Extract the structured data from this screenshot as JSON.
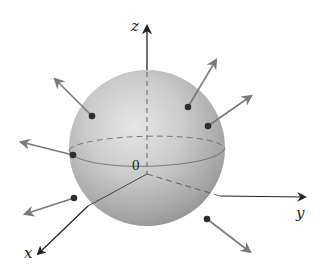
{
  "figure": {
    "colors": {
      "background": "#ffffff",
      "sphere_light": "#e4e4e4",
      "sphere_mid": "#c4c4c4",
      "sphere_dark": "#8e8e8e",
      "axis": "#222222",
      "normal_vector": "#7a7a7a",
      "point": "#2e2e2e",
      "equator": "#6f6f6f"
    },
    "axes": {
      "z": {
        "label": "z"
      },
      "y": {
        "label": "y"
      },
      "x": {
        "label": "x"
      }
    },
    "origin_label": "0",
    "sphere": {
      "cx": 147,
      "cy": 148,
      "r": 78
    },
    "normal_vectors": [
      {
        "id": "nv-1",
        "point": [
          92,
          116
        ],
        "tip": [
          55,
          79
        ]
      },
      {
        "id": "nv-2",
        "point": [
          188,
          107
        ],
        "tip": [
          216,
          60
        ]
      },
      {
        "id": "nv-3",
        "point": [
          208,
          126
        ],
        "tip": [
          251,
          96
        ]
      },
      {
        "id": "nv-4",
        "point": [
          73,
          155
        ],
        "tip": [
          21,
          142
        ]
      },
      {
        "id": "nv-5",
        "point": [
          74,
          198
        ],
        "tip": [
          25,
          214
        ]
      },
      {
        "id": "nv-6",
        "point": [
          207,
          219
        ],
        "tip": [
          250,
          252
        ]
      }
    ]
  }
}
